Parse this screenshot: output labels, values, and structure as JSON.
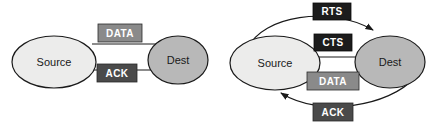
{
  "figure": {
    "background": "#ffffff",
    "stroke": "#1a1a1a"
  },
  "palette": {
    "node_light": "#ececeb",
    "node_medium": "#b8b8b8",
    "box_medium": "#8a8a8a",
    "box_dark": "#4a4a4a",
    "box_black": "#1c1c1c",
    "text_dark": "#1a1a1a",
    "text_light": "#ffffff"
  },
  "diagrams": [
    {
      "id": "stop-and-wait",
      "nodes": [
        {
          "id": "source-left",
          "label": "Source",
          "fill": "#ececeb",
          "cx": 54,
          "cy": 62,
          "rx": 42,
          "ry": 26
        },
        {
          "id": "dest-left",
          "label": "Dest",
          "fill": "#b8b8b8",
          "cx": 178,
          "cy": 60,
          "rx": 30,
          "ry": 24
        }
      ],
      "messages": [
        {
          "id": "data-left",
          "label": "DATA",
          "fill": "#8a8a8a",
          "direction": "source-to-dest",
          "box": {
            "x": 98,
            "y": 24,
            "w": 44,
            "h": 18
          }
        },
        {
          "id": "ack-left",
          "label": "ACK",
          "fill": "#4a4a4a",
          "direction": "dest-to-source",
          "box": {
            "x": 97,
            "y": 64,
            "w": 40,
            "h": 18
          }
        }
      ]
    },
    {
      "id": "rts-cts-handshake",
      "nodes": [
        {
          "id": "source-right",
          "label": "Source",
          "fill": "#ececeb",
          "cx": 275,
          "cy": 63,
          "rx": 45,
          "ry": 27
        },
        {
          "id": "dest-right",
          "label": "Dest",
          "fill": "#b8b8b8",
          "cx": 390,
          "cy": 62,
          "rx": 35,
          "ry": 26
        }
      ],
      "messages": [
        {
          "id": "rts-right",
          "label": "RTS",
          "fill": "#1c1c1c",
          "direction": "source-to-dest",
          "box": {
            "x": 313,
            "y": 3,
            "w": 38,
            "h": 17
          }
        },
        {
          "id": "cts-right",
          "label": "CTS",
          "fill": "#1c1c1c",
          "direction": "dest-to-source",
          "box": {
            "x": 314,
            "y": 34,
            "w": 38,
            "h": 17
          }
        },
        {
          "id": "data-right",
          "label": "DATA",
          "fill": "#8a8a8a",
          "direction": "source-to-dest",
          "box": {
            "x": 307,
            "y": 72,
            "w": 52,
            "h": 18
          }
        },
        {
          "id": "ack-right",
          "label": "ACK",
          "fill": "#4a4a4a",
          "direction": "dest-to-source",
          "box": {
            "x": 313,
            "y": 103,
            "w": 40,
            "h": 18
          }
        }
      ]
    }
  ]
}
